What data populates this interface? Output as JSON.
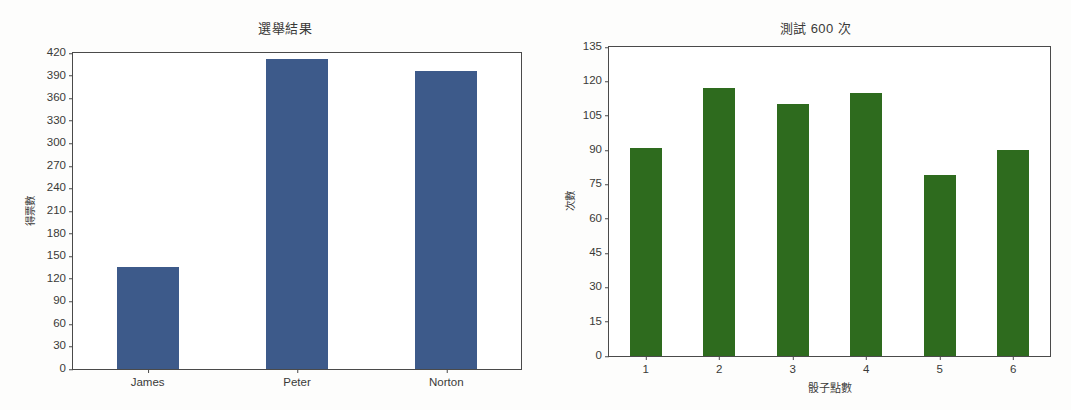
{
  "chart_data": [
    {
      "type": "bar",
      "id": "election-results",
      "title": "選舉結果",
      "xlabel": "",
      "ylabel": "得票數",
      "categories": [
        "James",
        "Peter",
        "Norton"
      ],
      "values": [
        135,
        412,
        396
      ],
      "ylim": [
        0,
        420
      ],
      "yticks": [
        0,
        30,
        60,
        90,
        120,
        150,
        180,
        210,
        240,
        270,
        300,
        330,
        360,
        390,
        420
      ],
      "bar_color": "#3d5a8a",
      "grid": false,
      "legend": "none"
    },
    {
      "type": "bar",
      "id": "dice-test",
      "title": "測試 600 次",
      "xlabel": "骰子點數",
      "ylabel": "次數",
      "categories": [
        "1",
        "2",
        "3",
        "4",
        "5",
        "6"
      ],
      "values": [
        91,
        117,
        110,
        115,
        79,
        90
      ],
      "ylim": [
        0,
        135
      ],
      "yticks": [
        0,
        15,
        30,
        45,
        60,
        75,
        90,
        105,
        120,
        135
      ],
      "bar_color": "#2e6b1e",
      "grid": false,
      "legend": "none"
    }
  ]
}
